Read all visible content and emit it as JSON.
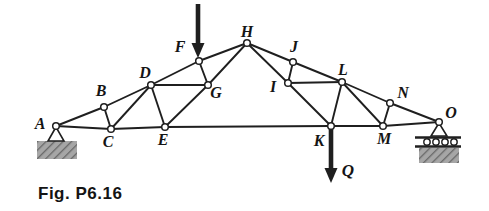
{
  "figure": {
    "caption": "Fig. P6.16",
    "colors": {
      "line": "#1f1f1f",
      "label": "#141414",
      "background": "#ffffff",
      "support_gray": "#a6a6a6",
      "support_hatch": "#686868"
    },
    "joints": [
      {
        "id": "A",
        "x": 56,
        "y": 126,
        "label_x": 40,
        "label_y": 129
      },
      {
        "id": "B",
        "x": 104,
        "y": 107,
        "label_x": 101,
        "label_y": 96
      },
      {
        "id": "C",
        "x": 111,
        "y": 129,
        "label_x": 108,
        "label_y": 147
      },
      {
        "id": "D",
        "x": 151,
        "y": 85,
        "label_x": 145,
        "label_y": 78
      },
      {
        "id": "E",
        "x": 165,
        "y": 127,
        "label_x": 163,
        "label_y": 145
      },
      {
        "id": "F",
        "x": 199,
        "y": 61,
        "label_x": 180,
        "label_y": 52
      },
      {
        "id": "G",
        "x": 208,
        "y": 85,
        "label_x": 216,
        "label_y": 98
      },
      {
        "id": "H",
        "x": 247,
        "y": 43,
        "label_x": 247,
        "label_y": 37
      },
      {
        "id": "I",
        "x": 288,
        "y": 83,
        "label_x": 273,
        "label_y": 92
      },
      {
        "id": "J",
        "x": 293,
        "y": 62,
        "label_x": 294,
        "label_y": 52
      },
      {
        "id": "K",
        "x": 331,
        "y": 126,
        "label_x": 319,
        "label_y": 146
      },
      {
        "id": "L",
        "x": 342,
        "y": 82,
        "label_x": 343,
        "label_y": 75
      },
      {
        "id": "M",
        "x": 383,
        "y": 126,
        "label_x": 384,
        "label_y": 144
      },
      {
        "id": "N",
        "x": 390,
        "y": 103,
        "label_x": 403,
        "label_y": 98
      },
      {
        "id": "O",
        "x": 439,
        "y": 122,
        "label_x": 451,
        "label_y": 118
      }
    ],
    "members": [
      [
        "A",
        "B"
      ],
      [
        "B",
        "D"
      ],
      [
        "D",
        "F"
      ],
      [
        "F",
        "H"
      ],
      [
        "H",
        "J"
      ],
      [
        "J",
        "L"
      ],
      [
        "L",
        "N"
      ],
      [
        "N",
        "O"
      ],
      [
        "A",
        "C"
      ],
      [
        "C",
        "E"
      ],
      [
        "E",
        "K"
      ],
      [
        "K",
        "M"
      ],
      [
        "M",
        "O"
      ],
      [
        "B",
        "C"
      ],
      [
        "C",
        "D"
      ],
      [
        "D",
        "E"
      ],
      [
        "D",
        "G"
      ],
      [
        "F",
        "G"
      ],
      [
        "E",
        "G"
      ],
      [
        "G",
        "H"
      ],
      [
        "H",
        "I"
      ],
      [
        "I",
        "J"
      ],
      [
        "I",
        "L"
      ],
      [
        "I",
        "K"
      ],
      [
        "K",
        "L"
      ],
      [
        "L",
        "M"
      ],
      [
        "M",
        "N"
      ]
    ],
    "loads": [
      {
        "at": "F",
        "label": "",
        "x": 198,
        "y_start": 4,
        "y_tip": 58,
        "label_x": 0,
        "label_y": 0
      },
      {
        "at": "K",
        "label": "Q",
        "x": 331,
        "y_start": 128,
        "y_tip": 183,
        "label_x": 348,
        "label_y": 176
      }
    ],
    "supports": [
      {
        "type": "pin",
        "joint": "A",
        "base_y": 141,
        "half_width": 8,
        "block": {
          "x": 37,
          "y": 141,
          "w": 40,
          "h": 18
        }
      },
      {
        "type": "roller",
        "joint": "O",
        "base_y": 136,
        "half_width": 8,
        "bar_x1": 415,
        "bar_x2": 461,
        "bar1_y": 137.5,
        "bar2_y": 146.5,
        "roller_y": 142,
        "roller_xs": [
          427,
          436,
          445,
          454
        ],
        "roller_r": 3.2,
        "block": {
          "x": 419,
          "y": 148,
          "w": 40,
          "h": 15
        }
      }
    ]
  }
}
